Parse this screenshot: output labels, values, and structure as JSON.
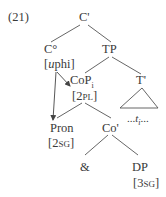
{
  "example_number": "(21)",
  "nodes": {
    "c_bar": {
      "label": "C'"
    },
    "c_zero": {
      "label": "C°",
      "feature_prefix": "[",
      "feature_italic": "u",
      "feature_rest": "phi]"
    },
    "tp": {
      "label": "TP"
    },
    "cop": {
      "label": "CoP",
      "subscript": "i",
      "feature_open": "[2",
      "feature_sc": "pl",
      "feature_close": "]"
    },
    "t_bar": {
      "label": "T'"
    },
    "trace": {
      "prefix": "...",
      "label": "t",
      "subscript": "i",
      "suffix": "..."
    },
    "pron": {
      "label": "Pron",
      "feature_open": "[2",
      "feature_sc": "sg",
      "feature_close": "]"
    },
    "co_bar": {
      "label": "Co'"
    },
    "ampersand": {
      "label": "&"
    },
    "dp": {
      "label": "DP",
      "feature_open": "[3",
      "feature_sc": "sg",
      "feature_close": "]"
    }
  },
  "colors": {
    "text": "#3a3a3a",
    "lines": "#555555"
  }
}
